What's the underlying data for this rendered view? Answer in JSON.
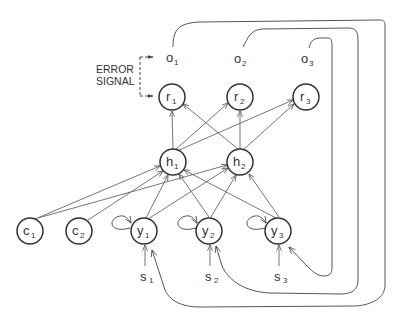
{
  "diagram": {
    "annotation": {
      "line1": "ERROR",
      "line2": "SIGNAL"
    },
    "outputs": [
      {
        "id": "o1",
        "base": "o",
        "sub": "1"
      },
      {
        "id": "o2",
        "base": "o",
        "sub": "2"
      },
      {
        "id": "o3",
        "base": "o",
        "sub": "3"
      }
    ],
    "nodes": {
      "r1": {
        "base": "r",
        "sub": "1"
      },
      "r2": {
        "base": "r",
        "sub": "2"
      },
      "r3": {
        "base": "r",
        "sub": "3"
      },
      "h1": {
        "base": "h",
        "sub": "1"
      },
      "h2": {
        "base": "h",
        "sub": "2"
      },
      "c1": {
        "base": "c",
        "sub": "1"
      },
      "c2": {
        "base": "c",
        "sub": "2"
      },
      "y1": {
        "base": "y",
        "sub": "1"
      },
      "y2": {
        "base": "y",
        "sub": "2"
      },
      "y3": {
        "base": "y",
        "sub": "3"
      }
    },
    "inputs": [
      {
        "id": "s1",
        "base": "s",
        "sub": "1"
      },
      {
        "id": "s2",
        "base": "s",
        "sub": "2"
      },
      {
        "id": "s3",
        "base": "s",
        "sub": "3"
      }
    ],
    "edges": [
      [
        "h1",
        "r1"
      ],
      [
        "h1",
        "r2"
      ],
      [
        "h1",
        "r3"
      ],
      [
        "h2",
        "r1"
      ],
      [
        "h2",
        "r2"
      ],
      [
        "h2",
        "r3"
      ],
      [
        "c1",
        "h1"
      ],
      [
        "c1",
        "h2"
      ],
      [
        "c2",
        "h1"
      ],
      [
        "y1",
        "h1"
      ],
      [
        "y1",
        "h2"
      ],
      [
        "y2",
        "h1"
      ],
      [
        "y2",
        "h2"
      ],
      [
        "y3",
        "h1"
      ],
      [
        "y3",
        "h2"
      ],
      [
        "y1",
        "y1"
      ],
      [
        "y2",
        "y2"
      ],
      [
        "y3",
        "y3"
      ],
      [
        "s1",
        "y1"
      ],
      [
        "s2",
        "y2"
      ],
      [
        "s3",
        "y3"
      ],
      [
        "o1",
        "y1"
      ],
      [
        "o2",
        "y2"
      ],
      [
        "o3",
        "y3"
      ]
    ]
  }
}
